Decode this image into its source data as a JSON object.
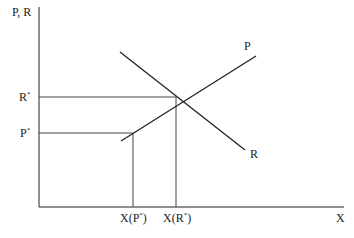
{
  "diagram": {
    "type": "supply-demand style intersection diagram",
    "y_axis_label": "P, R",
    "x_axis_label": "X",
    "curves": [
      {
        "name": "P",
        "label": "P",
        "direction": "upward-sloping",
        "x1": 121,
        "y1": 141,
        "x2": 256,
        "y2": 56
      },
      {
        "name": "R",
        "label": "R",
        "direction": "downward-sloping",
        "x1": 120,
        "y1": 52,
        "x2": 245,
        "y2": 150
      }
    ],
    "y_markers": [
      {
        "label": "R",
        "sup": "*",
        "y": 97,
        "x_end": 176
      },
      {
        "label": "P",
        "sup": "*",
        "y": 133,
        "x_end": 133
      }
    ],
    "x_markers": [
      {
        "label_prefix": "X(P",
        "sup": "*",
        "label_suffix": ")",
        "x": 133
      },
      {
        "label_prefix": "X(R",
        "sup": "*",
        "label_suffix": ")",
        "x": 176
      }
    ],
    "colors": {
      "line": "#222222",
      "guide": "#444444",
      "background": "#ffffff"
    }
  }
}
